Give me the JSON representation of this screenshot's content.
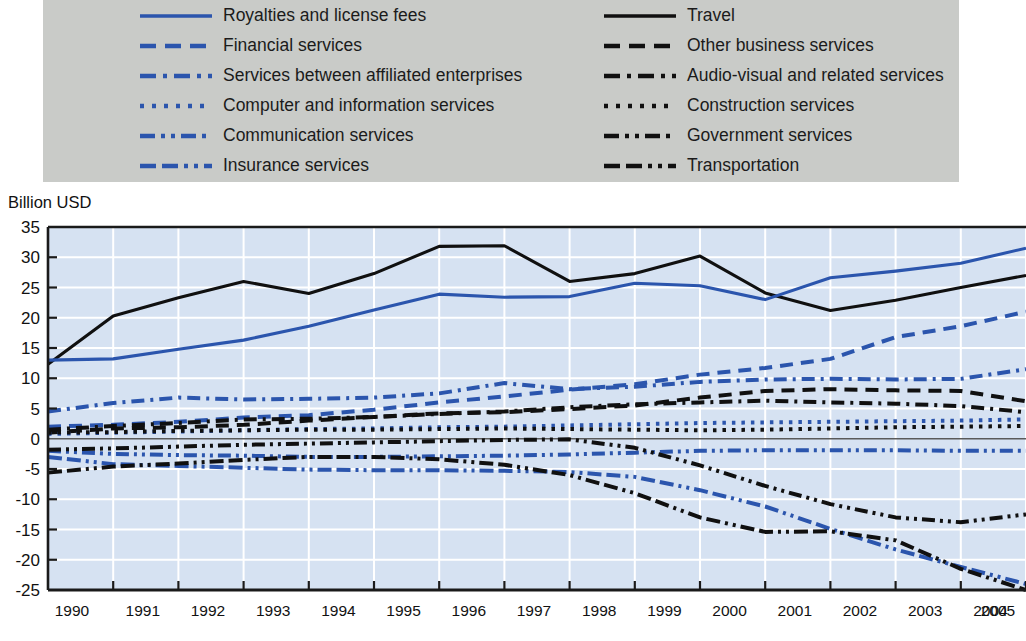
{
  "legend": {
    "background_color": "#c9cbc8",
    "left_column": [
      {
        "label": "Royalties and license fees",
        "color": "#2b55ad",
        "style": "solid"
      },
      {
        "label": "Financial services",
        "color": "#2b55ad",
        "style": "dashed"
      },
      {
        "label": "Services between affiliated enterprises",
        "color": "#2b55ad",
        "style": "dashdot"
      },
      {
        "label": "Computer and information services",
        "color": "#2b55ad",
        "style": "dotted"
      },
      {
        "label": "Communication services",
        "color": "#2b55ad",
        "style": "dashdotdot"
      },
      {
        "label": "Insurance services",
        "color": "#2b55ad",
        "style": "dashdashdotdot"
      }
    ],
    "right_column": [
      {
        "label": "Travel",
        "color": "#101010",
        "style": "solid"
      },
      {
        "label": "Other business services",
        "color": "#101010",
        "style": "dashed"
      },
      {
        "label": "Audio-visual and related services",
        "color": "#101010",
        "style": "dashdot"
      },
      {
        "label": "Construction services",
        "color": "#101010",
        "style": "dotted"
      },
      {
        "label": "Government services",
        "color": "#101010",
        "style": "dashdotdot"
      },
      {
        "label": "Transportation",
        "color": "#101010",
        "style": "dashdashdotdot"
      }
    ]
  },
  "axis_title": "Billion USD",
  "colors": {
    "plot_background": "#d6e2f2",
    "gridline": "#ffffff",
    "axis": "#1a1a1a",
    "blue_series": "#2b55ad",
    "black_series": "#101010",
    "legend_background": "#c9cbc8"
  },
  "chart_data": {
    "type": "line",
    "title": "",
    "subtitle": "",
    "xlabel": "",
    "ylabel": "Billion USD",
    "ylim": [
      -25,
      35
    ],
    "yticks": [
      35,
      30,
      25,
      20,
      15,
      10,
      5,
      0,
      -5,
      -10,
      -15,
      -20,
      -25
    ],
    "grid": true,
    "legend_position": "top",
    "x": [
      1990,
      1991,
      1992,
      1993,
      1994,
      1995,
      1996,
      1997,
      1998,
      1999,
      2000,
      2001,
      2002,
      2003,
      2004,
      2005
    ],
    "categories": [
      "1990",
      "1991",
      "1992",
      "1993",
      "1994",
      "1995",
      "1996",
      "1997",
      "1998",
      "1999",
      "2000",
      "2001",
      "2002",
      "2003",
      "2004",
      "2005"
    ],
    "series": [
      {
        "name": "Travel",
        "color": "#101010",
        "style": "solid",
        "values": [
          12.3,
          20.3,
          23.3,
          26.0,
          24.0,
          27.3,
          31.8,
          31.9,
          26.0,
          27.3,
          30.2,
          24.1,
          21.2,
          22.9,
          25.0,
          27.0
        ]
      },
      {
        "name": "Royalties and license fees",
        "color": "#2b55ad",
        "style": "solid",
        "values": [
          13.0,
          13.2,
          14.8,
          16.3,
          18.6,
          21.3,
          23.9,
          23.4,
          23.5,
          25.7,
          25.3,
          23.0,
          26.6,
          27.7,
          29.0,
          31.5
        ]
      },
      {
        "name": "Financial services",
        "color": "#2b55ad",
        "style": "dashed",
        "values": [
          2.0,
          2.3,
          2.8,
          3.5,
          3.9,
          4.8,
          6.0,
          7.0,
          8.1,
          9.0,
          10.6,
          11.7,
          13.2,
          16.8,
          18.6,
          21.0
        ]
      },
      {
        "name": "Other business services",
        "color": "#101010",
        "style": "dashed",
        "values": [
          1.0,
          1.7,
          1.9,
          2.3,
          3.0,
          3.6,
          4.2,
          4.4,
          4.9,
          5.5,
          6.8,
          7.9,
          8.2,
          8.0,
          7.9,
          6.2
        ]
      },
      {
        "name": "Services between affiliated enterprises",
        "color": "#2b55ad",
        "style": "dashdot",
        "values": [
          4.5,
          5.9,
          6.8,
          6.5,
          6.6,
          6.8,
          7.5,
          9.2,
          8.2,
          8.6,
          9.4,
          9.8,
          9.9,
          9.8,
          9.9,
          11.5
        ]
      },
      {
        "name": "Audio-visual and related services",
        "color": "#101010",
        "style": "dashdot",
        "values": [
          1.5,
          2.1,
          2.6,
          3.2,
          3.3,
          3.6,
          4.1,
          4.5,
          5.2,
          5.7,
          6.0,
          6.3,
          6.0,
          5.8,
          5.4,
          4.4
        ]
      },
      {
        "name": "Computer and information services",
        "color": "#2b55ad",
        "style": "dotted",
        "values": [
          0.8,
          1.0,
          1.2,
          1.4,
          1.6,
          1.7,
          1.9,
          2.0,
          2.2,
          2.4,
          2.6,
          2.7,
          2.8,
          2.9,
          3.0,
          3.2
        ]
      },
      {
        "name": "Construction services",
        "color": "#101010",
        "style": "dotted",
        "values": [
          1.0,
          1.1,
          1.3,
          1.4,
          1.5,
          1.5,
          1.6,
          1.7,
          1.6,
          1.5,
          1.4,
          1.5,
          1.7,
          1.9,
          2.0,
          2.1
        ]
      },
      {
        "name": "Communication services",
        "color": "#2b55ad",
        "style": "dashdotdot",
        "values": [
          -2.0,
          -2.5,
          -2.7,
          -2.8,
          -3.0,
          -3.0,
          -2.9,
          -2.8,
          -2.6,
          -2.3,
          -2.0,
          -1.9,
          -1.9,
          -1.9,
          -2.0,
          -2.0
        ]
      },
      {
        "name": "Government services",
        "color": "#101010",
        "style": "dashdotdot",
        "values": [
          -1.8,
          -1.6,
          -1.3,
          -1.0,
          -0.8,
          -0.6,
          -0.4,
          -0.2,
          -0.1,
          -1.5,
          -4.4,
          -7.8,
          -10.8,
          -13.0,
          -13.8,
          -12.5
        ]
      },
      {
        "name": "Insurance services",
        "color": "#2b55ad",
        "style": "dashdashdotdot",
        "values": [
          -3.0,
          -4.2,
          -4.5,
          -4.8,
          -5.1,
          -5.2,
          -5.2,
          -5.3,
          -5.5,
          -6.3,
          -8.5,
          -11.2,
          -14.9,
          -18.3,
          -21.2,
          -24.0
        ]
      },
      {
        "name": "Transportation",
        "color": "#101010",
        "style": "dashdashdotdot",
        "values": [
          -5.6,
          -4.6,
          -4.1,
          -3.5,
          -3.0,
          -3.0,
          -3.4,
          -4.3,
          -6.0,
          -9.0,
          -13.0,
          -15.4,
          -15.3,
          -16.8,
          -21.5,
          -25.0
        ]
      }
    ]
  }
}
